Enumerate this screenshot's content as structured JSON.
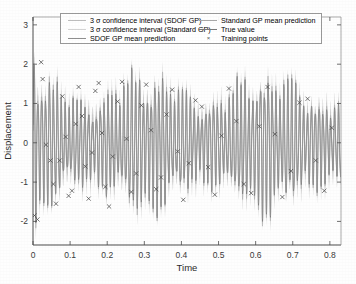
{
  "chart_data": {
    "type": "line",
    "title": "",
    "xlabel": "Time",
    "ylabel": "Displacement",
    "xlim": [
      0,
      0.83
    ],
    "ylim": [
      -2.6,
      3.2
    ],
    "xticks": [
      0,
      0.1,
      0.2,
      0.3,
      0.4,
      0.5,
      0.6,
      0.7,
      0.8
    ],
    "xticklabels": [
      "0",
      "0.1",
      "0.2",
      "0.3",
      "0.4",
      "0.5",
      "0.6",
      "0.7",
      "0.8"
    ],
    "yticks": [
      3,
      2,
      1,
      0,
      -1,
      -2
    ],
    "yticklabels": [
      "3",
      "2",
      "1",
      "0",
      "-1",
      "-2"
    ],
    "grid": false,
    "legend_position": "upper-center",
    "series": [
      {
        "name": "3 $\\sigma$ confidence interval (SDOF GP)",
        "kind": "band",
        "color": "#b9b9b9"
      },
      {
        "name": "3 $\\sigma$ confidence interval (Standard GP)",
        "kind": "band",
        "color": "#cfcfcf"
      },
      {
        "name": "SDOF GP mean prediction",
        "kind": "line",
        "color": "#8f8f8f"
      },
      {
        "name": "Standard GP mean prediction",
        "kind": "line",
        "color": "#a8a8a8"
      },
      {
        "name": "True value",
        "kind": "line",
        "color": "#7a7a7a"
      },
      {
        "name": "Training points",
        "kind": "scatter",
        "color": "#555555",
        "marker": "x"
      }
    ],
    "signal_description": {
      "waveform": "amplitude-modulated high-frequency oscillation, frequency approx 95 Hz, beating envelope",
      "carrier_frequency_hz": 95,
      "beat_frequency_hz": 7,
      "peak_amplitude": 2.3,
      "n_training_points": 58,
      "initial_transient_peak": 3.0,
      "initial_transient_time": 0.02
    },
    "training_points": [
      {
        "x": 0.004,
        "y": -1.85
      },
      {
        "x": 0.012,
        "y": -1.95
      },
      {
        "x": 0.022,
        "y": 2.05
      },
      {
        "x": 0.026,
        "y": 1.62
      },
      {
        "x": 0.035,
        "y": -0.05
      },
      {
        "x": 0.047,
        "y": -0.45
      },
      {
        "x": 0.055,
        "y": -1.05
      },
      {
        "x": 0.062,
        "y": -1.55
      },
      {
        "x": 0.072,
        "y": -0.45
      },
      {
        "x": 0.079,
        "y": 1.18
      },
      {
        "x": 0.088,
        "y": 0.15
      },
      {
        "x": 0.096,
        "y": -1.35
      },
      {
        "x": 0.105,
        "y": -1.22
      },
      {
        "x": 0.115,
        "y": 0.48
      },
      {
        "x": 0.123,
        "y": 1.42
      },
      {
        "x": 0.132,
        "y": 0.68
      },
      {
        "x": 0.141,
        "y": -0.6
      },
      {
        "x": 0.15,
        "y": -1.42
      },
      {
        "x": 0.159,
        "y": -0.25
      },
      {
        "x": 0.168,
        "y": 1.32
      },
      {
        "x": 0.177,
        "y": 1.52
      },
      {
        "x": 0.186,
        "y": 0.25
      },
      {
        "x": 0.195,
        "y": -1.12
      },
      {
        "x": 0.205,
        "y": -1.62
      },
      {
        "x": 0.215,
        "y": -0.35
      },
      {
        "x": 0.228,
        "y": 1.05
      },
      {
        "x": 0.24,
        "y": 1.55
      },
      {
        "x": 0.252,
        "y": 0.1
      },
      {
        "x": 0.265,
        "y": -1.25
      },
      {
        "x": 0.278,
        "y": -0.78
      },
      {
        "x": 0.292,
        "y": 0.95
      },
      {
        "x": 0.305,
        "y": 1.48
      },
      {
        "x": 0.318,
        "y": 0.32
      },
      {
        "x": 0.332,
        "y": -1.18
      },
      {
        "x": 0.345,
        "y": -0.88
      },
      {
        "x": 0.36,
        "y": 0.72
      },
      {
        "x": 0.375,
        "y": 1.35
      },
      {
        "x": 0.39,
        "y": -0.22
      },
      {
        "x": 0.405,
        "y": -1.45
      },
      {
        "x": 0.42,
        "y": -0.52
      },
      {
        "x": 0.438,
        "y": 1.08
      },
      {
        "x": 0.455,
        "y": 0.92
      },
      {
        "x": 0.472,
        "y": -0.62
      },
      {
        "x": 0.49,
        "y": -1.32
      },
      {
        "x": 0.508,
        "y": 0.18
      },
      {
        "x": 0.528,
        "y": 1.38
      },
      {
        "x": 0.548,
        "y": 0.55
      },
      {
        "x": 0.568,
        "y": -1.05
      },
      {
        "x": 0.588,
        "y": -1.28
      },
      {
        "x": 0.61,
        "y": 0.42
      },
      {
        "x": 0.632,
        "y": 1.42
      },
      {
        "x": 0.652,
        "y": 0.22
      },
      {
        "x": 0.672,
        "y": -1.38
      },
      {
        "x": 0.695,
        "y": -0.72
      },
      {
        "x": 0.718,
        "y": 1.02
      },
      {
        "x": 0.74,
        "y": 1.12
      },
      {
        "x": 0.762,
        "y": -0.45
      },
      {
        "x": 0.785,
        "y": -1.22
      },
      {
        "x": 0.805,
        "y": 0.38
      }
    ]
  },
  "legend": {
    "items": [
      {
        "label": "3 σ confidence interval (SDOF GP)",
        "marker": "line",
        "column": 1
      },
      {
        "label": "3 σ confidence interval (Standard GP)",
        "marker": "line",
        "column": 1
      },
      {
        "label": "SDOF GP mean prediction",
        "marker": "line",
        "column": 1
      },
      {
        "label": "Standard GP mean prediction",
        "marker": "line",
        "column": 2
      },
      {
        "label": "True value",
        "marker": "line",
        "column": 2
      },
      {
        "label": "Training points",
        "marker": "x",
        "column": 2
      }
    ]
  },
  "axes": {
    "xlabel": "Time",
    "ylabel": "Displacement",
    "xticklabels": [
      "0",
      "0.1",
      "0.2",
      "0.3",
      "0.4",
      "0.5",
      "0.6",
      "0.7",
      "0.8"
    ],
    "yticklabels": [
      "3",
      "2",
      "1",
      "0",
      "-1",
      "-2"
    ]
  },
  "colors": {
    "axis": "#4d4d4d",
    "true_value": "#7a7a7a",
    "sdof_mean": "#8f8f8f",
    "standard_mean": "#a8a8a8",
    "band_sdof": "#bdbdbd",
    "band_standard": "#d4d4d4",
    "marker": "#4a4a4a",
    "background": "#ffffff"
  }
}
